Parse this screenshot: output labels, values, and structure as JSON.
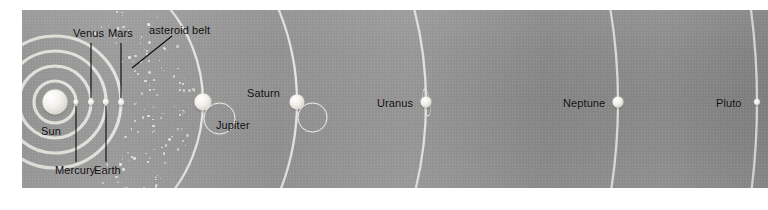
{
  "figure": {
    "orientation": "heliocentric, Sun at left, planets in order of increasing distance",
    "background_color": "#8f8f8f",
    "orbit_color": "#eceae4",
    "label_color": "#0d0d0d",
    "body_color": "#f2f0ea"
  },
  "labels": {
    "sun": "Sun",
    "mercury": "Mercury",
    "venus": "Venus",
    "earth": "Earth",
    "mars": "Mars",
    "asteroid_belt": "asteroid belt",
    "jupiter": "Jupiter",
    "saturn": "Saturn",
    "uranus": "Uranus",
    "neptune": "Neptune",
    "pluto": "Pluto"
  },
  "chart_data": {
    "type": "scatter",
    "xlabel": "",
    "ylabel": "",
    "bodies": [
      {
        "name": "Sun",
        "x": 33,
        "y": 92,
        "radius": 12.5,
        "rings": "none",
        "label_position": "below",
        "leader": false
      },
      {
        "name": "Mercury",
        "x": 54,
        "y": 92,
        "radius": 2.6,
        "rings": "none",
        "label_position": "below",
        "leader": true
      },
      {
        "name": "Venus",
        "x": 69,
        "y": 92,
        "radius": 3.0,
        "rings": "none",
        "label_position": "above",
        "leader": true
      },
      {
        "name": "Earth",
        "x": 84,
        "y": 92,
        "radius": 3.2,
        "rings": "none",
        "label_position": "below",
        "leader": true
      },
      {
        "name": "Mars",
        "x": 99,
        "y": 92,
        "radius": 2.8,
        "rings": "none",
        "label_position": "above",
        "leader": true
      },
      {
        "name": "Jupiter",
        "x": 181,
        "y": 92,
        "radius": 8.5,
        "rings": "tilted",
        "label_position": "below-right",
        "leader": false
      },
      {
        "name": "Saturn",
        "x": 275,
        "y": 92,
        "radius": 7.5,
        "rings": "tilted",
        "label_position": "above-left",
        "leader": false
      },
      {
        "name": "Uranus",
        "x": 404,
        "y": 92,
        "radius": 5.5,
        "rings": "vertical",
        "label_position": "left",
        "leader": false
      },
      {
        "name": "Neptune",
        "x": 596,
        "y": 92,
        "radius": 5.5,
        "rings": "none",
        "label_position": "left",
        "leader": false
      },
      {
        "name": "Pluto",
        "x": 735,
        "y": 92,
        "radius": 3.0,
        "rings": "none",
        "label_position": "left",
        "leader": false
      }
    ],
    "orbit_radii": [
      21,
      36,
      51,
      66,
      148,
      242,
      371,
      563,
      702
    ],
    "orbit_center": {
      "x": 33,
      "y": 92
    },
    "asteroid_belt": {
      "inner_radius": 78,
      "outer_radius": 140,
      "dot_count": 150
    },
    "grid": false,
    "legend": "none"
  }
}
